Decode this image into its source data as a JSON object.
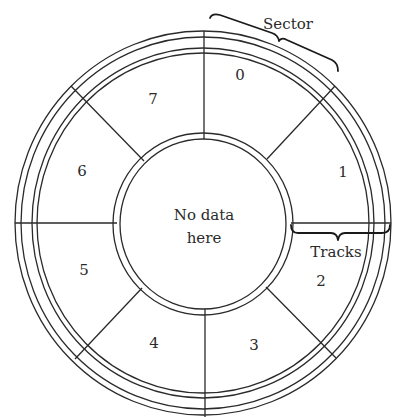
{
  "diagram": {
    "center_label_line1": "No data",
    "center_label_line2": "here",
    "annotations": {
      "sector": "Sector",
      "tracks": "Tracks"
    },
    "sectors": [
      {
        "label": "0"
      },
      {
        "label": "1"
      },
      {
        "label": "2"
      },
      {
        "label": "3"
      },
      {
        "label": "4"
      },
      {
        "label": "5"
      },
      {
        "label": "6"
      },
      {
        "label": "7"
      }
    ],
    "colors": {
      "line": "#2a2a2a",
      "background": "#ffffff"
    }
  }
}
